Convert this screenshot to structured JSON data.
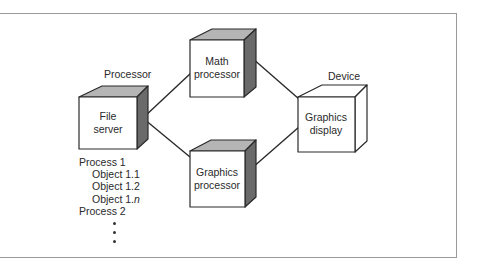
{
  "diagram": {
    "labels": {
      "processor": "Processor",
      "device": "Device"
    },
    "nodes": {
      "file_server": {
        "line1": "File",
        "line2": "server"
      },
      "math_processor": {
        "line1": "Math",
        "line2": "processor"
      },
      "graphics_processor": {
        "line1": "Graphics",
        "line2": "processor"
      },
      "graphics_display": {
        "line1": "Graphics",
        "line2": "display"
      }
    },
    "process_list": {
      "process1": "Process 1",
      "object1_prefix_1": "Object 1.1",
      "object1_prefix_2": "Object 1.2",
      "object1_n_prefix": "Object 1.",
      "object1_n_suffix": "n",
      "process2": "Process 2",
      "ellipsis_dots": 3
    },
    "edges": [
      {
        "from": "File server",
        "to": "Math processor"
      },
      {
        "from": "File server",
        "to": "Graphics processor"
      },
      {
        "from": "Math processor",
        "to": "Graphics display"
      },
      {
        "from": "Graphics processor",
        "to": "Graphics display"
      }
    ],
    "colors": {
      "cube_top": "#b5b5b5",
      "cube_side": "#6a6a6a",
      "outline": "#2a2a2a",
      "frame": "#9a9a9a"
    }
  }
}
